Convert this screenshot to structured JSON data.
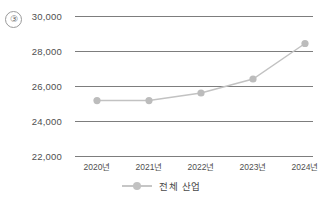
{
  "item_number": "③",
  "legend": {
    "position": "bottom",
    "entries": [
      {
        "label": "전체 산업",
        "color": "#c2c2c2",
        "marker": "circle"
      }
    ]
  },
  "colors": {
    "line": "#c2c2c2",
    "marker": "#bcbcbc",
    "grid": "#7d7d7d",
    "text": "#4f4f4f"
  },
  "chart_data": {
    "type": "line",
    "title": "",
    "subtitle": "",
    "xlabel": "",
    "ylabel": "",
    "categories": [
      "2020년",
      "2021년",
      "2022년",
      "2023년",
      "2024년"
    ],
    "ytick_labels": [
      "22,000",
      "24,000",
      "26,000",
      "28,000",
      "30,000"
    ],
    "yticks": [
      22000,
      24000,
      26000,
      28000,
      30000
    ],
    "ylim": [
      22000,
      30000
    ],
    "grid": "horizontal",
    "legend_position": "bottom",
    "series": [
      {
        "name": "전체 산업",
        "values": [
          25170,
          25170,
          25600,
          26400,
          28430
        ]
      }
    ]
  }
}
